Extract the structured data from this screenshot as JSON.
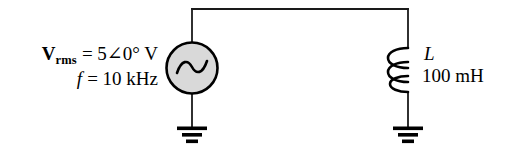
{
  "figure": {
    "background_color": "#ffffff",
    "wire_color": "#1a1a1a",
    "source_fill_color": "#d9d9d9",
    "text_color": "#000000"
  },
  "source": {
    "name": "ac-voltage-source",
    "symbol": "sine-wave",
    "voltage_symbol": "V",
    "voltage_subscript": "rms",
    "voltage_equals": "=",
    "voltage_magnitude": "5",
    "angle_glyph": "∠0°",
    "voltage_unit": "V",
    "voltage_line": "= 5∠0° V",
    "frequency_symbol": "f",
    "frequency_line": "= 10 kHz",
    "frequency_value": "10",
    "frequency_unit": "kHz"
  },
  "inductor": {
    "name": "inductor",
    "designator": "L",
    "value": "100 mH",
    "value_number": "100",
    "value_unit": "mH",
    "turns": 3
  },
  "grounds": [
    {
      "name": "ground-source",
      "bars": 3
    },
    {
      "name": "ground-inductor",
      "bars": 3
    }
  ],
  "wires": {
    "top_rail": "top-wire",
    "left_branch": "source-branch",
    "right_branch": "inductor-branch"
  }
}
